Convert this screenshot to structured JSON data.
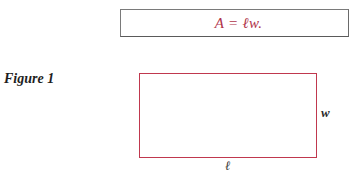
{
  "formula": {
    "text": "A = ℓw.",
    "color": "#b0344a"
  },
  "figure": {
    "label": "Figure 1",
    "rectangle_color": "#c0384e",
    "side_width_label": "w",
    "side_length_label": "ℓ"
  }
}
